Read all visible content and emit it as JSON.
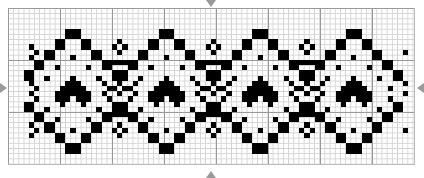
{
  "chart_data": {
    "type": "pattern-grid",
    "title": "",
    "grid": {
      "columns": 78,
      "rows": 30,
      "major_every": 10,
      "cell_px": 5.2
    },
    "colors": {
      "filled": "#000000",
      "grid_minor": "#d2d2d2",
      "grid_major": "#9a9a9a",
      "center_arrow": "#9a9a9a"
    },
    "center_markers": [
      "top",
      "bottom",
      "left",
      "right"
    ],
    "motif": {
      "repeat_columns": 18,
      "centers": [
        12,
        30,
        48,
        66
      ],
      "cells": [
        [
          4,
          -1
        ],
        [
          4,
          0
        ],
        [
          4,
          1
        ],
        [
          5,
          -1
        ],
        [
          5,
          0
        ],
        [
          5,
          1
        ],
        [
          6,
          -3
        ],
        [
          6,
          -2
        ],
        [
          6,
          2
        ],
        [
          6,
          3
        ],
        [
          7,
          -3
        ],
        [
          7,
          -2
        ],
        [
          7,
          2
        ],
        [
          7,
          3
        ],
        [
          8,
          -5
        ],
        [
          8,
          -4
        ],
        [
          8,
          4
        ],
        [
          8,
          5
        ],
        [
          9,
          -5
        ],
        [
          9,
          -4
        ],
        [
          9,
          4
        ],
        [
          9,
          5
        ],
        [
          9,
          0
        ],
        [
          10,
          -7
        ],
        [
          10,
          -6
        ],
        [
          10,
          6
        ],
        [
          10,
          7
        ],
        [
          11,
          -7
        ],
        [
          11,
          -6
        ],
        [
          11,
          6
        ],
        [
          11,
          7
        ],
        [
          11,
          -3
        ],
        [
          11,
          3
        ],
        [
          12,
          -9
        ],
        [
          12,
          -8
        ],
        [
          12,
          8
        ],
        [
          12,
          9
        ],
        [
          13,
          -9
        ],
        [
          13,
          -8
        ],
        [
          13,
          8
        ],
        [
          13,
          9
        ],
        [
          13,
          -5
        ],
        [
          13,
          5
        ],
        [
          13,
          0
        ],
        [
          14,
          -1
        ],
        [
          14,
          0
        ],
        [
          14,
          1
        ],
        [
          15,
          -2
        ],
        [
          15,
          -1
        ],
        [
          15,
          0
        ],
        [
          15,
          1
        ],
        [
          15,
          2
        ],
        [
          16,
          -3
        ],
        [
          16,
          -2
        ],
        [
          16,
          -1
        ],
        [
          16,
          0
        ],
        [
          16,
          1
        ],
        [
          16,
          2
        ],
        [
          16,
          3
        ],
        [
          17,
          -3
        ],
        [
          17,
          -2
        ],
        [
          17,
          -1
        ],
        [
          17,
          1
        ],
        [
          17,
          2
        ],
        [
          17,
          3
        ],
        [
          18,
          -2
        ],
        [
          18,
          2
        ],
        [
          15,
          -7
        ],
        [
          15,
          7
        ],
        [
          17,
          -7
        ],
        [
          17,
          7
        ],
        [
          18,
          -9
        ],
        [
          18,
          -8
        ],
        [
          18,
          8
        ],
        [
          18,
          9
        ],
        [
          19,
          -9
        ],
        [
          19,
          -8
        ],
        [
          19,
          8
        ],
        [
          19,
          9
        ],
        [
          19,
          -5
        ],
        [
          19,
          5
        ],
        [
          20,
          -7
        ],
        [
          20,
          -6
        ],
        [
          20,
          6
        ],
        [
          20,
          7
        ],
        [
          21,
          -7
        ],
        [
          21,
          -6
        ],
        [
          21,
          6
        ],
        [
          21,
          7
        ],
        [
          21,
          -3
        ],
        [
          21,
          3
        ],
        [
          22,
          -5
        ],
        [
          22,
          -4
        ],
        [
          22,
          4
        ],
        [
          22,
          5
        ],
        [
          23,
          -5
        ],
        [
          23,
          -4
        ],
        [
          23,
          4
        ],
        [
          23,
          5
        ],
        [
          23,
          0
        ],
        [
          24,
          -3
        ],
        [
          24,
          -2
        ],
        [
          24,
          2
        ],
        [
          24,
          3
        ],
        [
          25,
          -3
        ],
        [
          25,
          -2
        ],
        [
          25,
          2
        ],
        [
          25,
          3
        ],
        [
          26,
          -1
        ],
        [
          26,
          0
        ],
        [
          26,
          1
        ],
        [
          27,
          -1
        ],
        [
          27,
          0
        ],
        [
          27,
          1
        ]
      ]
    },
    "ornament": {
      "offset_from_center": 9,
      "cells": [
        [
          6,
          0
        ],
        [
          7,
          -1
        ],
        [
          7,
          1
        ],
        [
          8,
          0
        ],
        [
          10,
          -2
        ],
        [
          10,
          -1
        ],
        [
          10,
          0
        ],
        [
          10,
          1
        ],
        [
          10,
          2
        ],
        [
          14,
          0
        ],
        [
          15,
          -1
        ],
        [
          15,
          1
        ],
        [
          16,
          0
        ],
        [
          14,
          -3
        ],
        [
          14,
          3
        ],
        [
          16,
          -3
        ],
        [
          16,
          3
        ],
        [
          20,
          -2
        ],
        [
          20,
          -1
        ],
        [
          20,
          0
        ],
        [
          20,
          1
        ],
        [
          20,
          2
        ],
        [
          22,
          0
        ],
        [
          23,
          -1
        ],
        [
          23,
          1
        ],
        [
          24,
          0
        ]
      ]
    },
    "edge_cells": [
      [
        7,
        4
      ],
      [
        8,
        5
      ],
      [
        9,
        4
      ],
      [
        14,
        4
      ],
      [
        15,
        5
      ],
      [
        16,
        4
      ],
      [
        22,
        4
      ],
      [
        23,
        5
      ],
      [
        24,
        4
      ],
      [
        8,
        76
      ],
      [
        14,
        76
      ],
      [
        16,
        76
      ],
      [
        23,
        76
      ]
    ]
  }
}
